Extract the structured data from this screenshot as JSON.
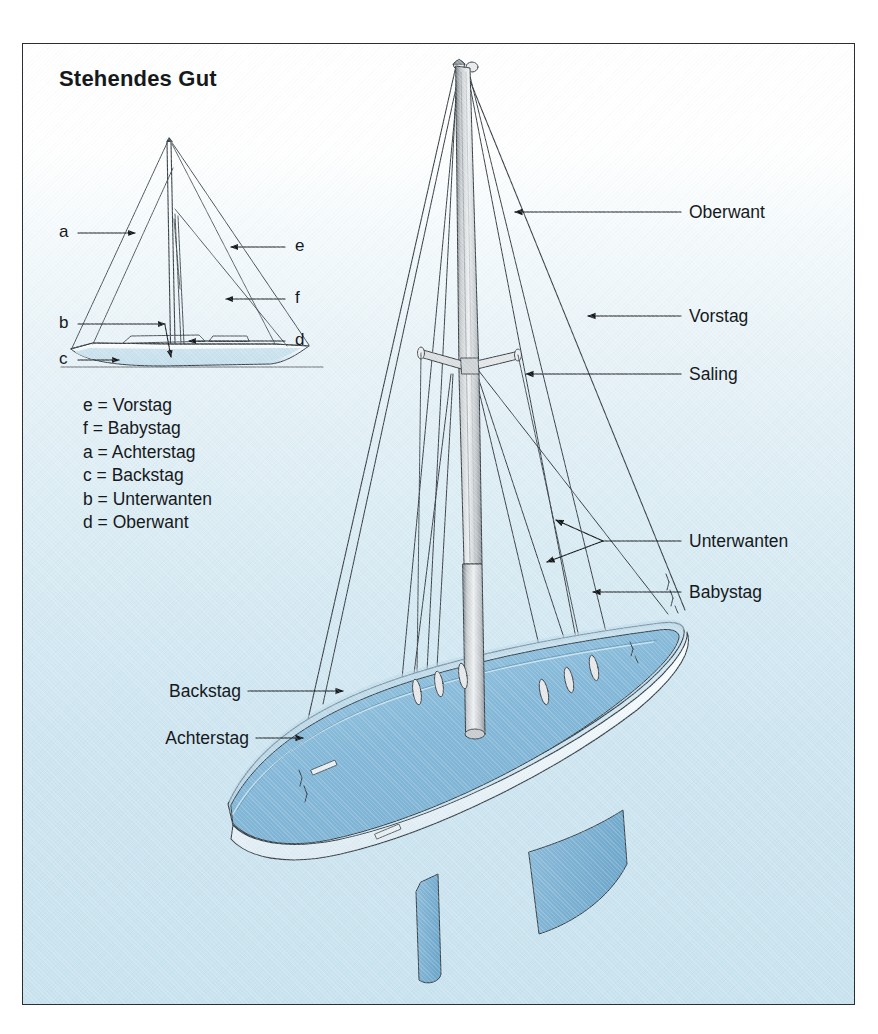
{
  "figure": {
    "title": "Stehendes Gut",
    "background_top_color": "#ffffff",
    "background_bottom_color": "#c9e3ef",
    "border_color": "#2b2f33",
    "hull_deck_color": "#84b8d8",
    "hull_white_color": "#f4fbfd",
    "keel_color": "#7fb4d4",
    "mast_color": "#d9d9d9",
    "line_color": "#2b2f33"
  },
  "legend": {
    "items": [
      {
        "key": "e",
        "label": "Vorstag",
        "text": "e = Vorstag"
      },
      {
        "key": "f",
        "label": "Babystag",
        "text": "f = Babystag"
      },
      {
        "key": "a",
        "label": "Achterstag",
        "text": "a = Achterstag"
      },
      {
        "key": "c",
        "label": "Backstag",
        "text": "c = Backstag"
      },
      {
        "key": "b",
        "label": "Unterwanten",
        "text": "b = Unterwanten"
      },
      {
        "key": "d",
        "label": "Oberwant",
        "text": "d = Oberwant"
      }
    ]
  },
  "mini_diagram": {
    "callouts": [
      {
        "key": "a",
        "text": "a",
        "side": "left"
      },
      {
        "key": "b",
        "text": "b",
        "side": "left"
      },
      {
        "key": "c",
        "text": "c",
        "side": "left"
      },
      {
        "key": "e",
        "text": "e",
        "side": "right"
      },
      {
        "key": "f",
        "text": "f",
        "side": "right"
      },
      {
        "key": "d",
        "text": "d",
        "side": "right"
      }
    ]
  },
  "main_diagram": {
    "labels_right": [
      {
        "name": "oberwant",
        "text": "Oberwant"
      },
      {
        "name": "vorstag",
        "text": "Vorstag"
      },
      {
        "name": "saling",
        "text": "Saling"
      },
      {
        "name": "unterwanten",
        "text": "Unterwanten"
      },
      {
        "name": "babystag",
        "text": "Babystag"
      }
    ],
    "labels_left": [
      {
        "name": "backstag",
        "text": "Backstag"
      },
      {
        "name": "achterstag",
        "text": "Achterstag"
      }
    ]
  }
}
